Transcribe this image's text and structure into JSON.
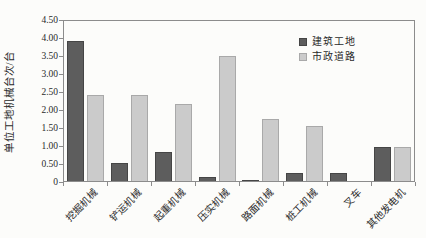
{
  "chart_data": {
    "type": "bar",
    "title": "",
    "xlabel": "",
    "ylabel": "单位工地机械台次/台",
    "categories": [
      "挖掘机械",
      "铲运机械",
      "起重机械",
      "压实机械",
      "路面机械",
      "桩工机械",
      "叉车",
      "其他发电机"
    ],
    "series": [
      {
        "key": "construction-site",
        "name": "建筑工地",
        "color": "#5d5d5d",
        "border_color": "#454545",
        "values": [
          3.88,
          0.5,
          0.81,
          0.1,
          0.04,
          0.21,
          0.21,
          0.94
        ]
      },
      {
        "key": "municipal-road",
        "name": "市政道路",
        "color": "#cbcbcb",
        "border_color": "#a9a9a9",
        "values": [
          2.38,
          2.38,
          2.14,
          3.48,
          1.72,
          1.52,
          0,
          0.94
        ]
      }
    ],
    "ylim": [
      0,
      4.5
    ],
    "ytick_step": 0.5,
    "ytick_labels": [
      "0",
      "0.50",
      "1.00",
      "1.50",
      "2.00",
      "2.50",
      "3.00",
      "3.50",
      "4.00",
      "4.50"
    ],
    "legend_position": "top-right",
    "grid": false,
    "axis_color": "#8c8c8c",
    "background_color": "#fcfcfa"
  }
}
